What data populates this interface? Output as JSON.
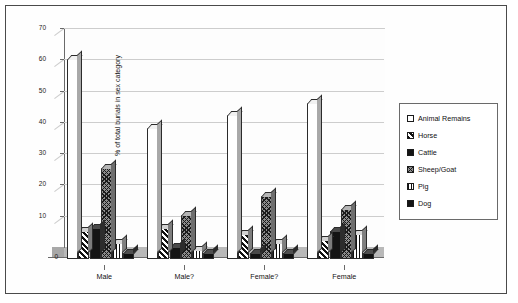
{
  "chart_data": {
    "type": "bar",
    "title": "",
    "xlabel": "",
    "ylabel": "% of total burials in sex category",
    "ylim": [
      0,
      70
    ],
    "yticks": [
      0,
      10,
      20,
      30,
      40,
      50,
      60,
      70
    ],
    "grid": true,
    "legend_position": "right",
    "style": "3d-clustered-column",
    "categories": [
      "Male",
      "Male?",
      "Female?",
      "Female"
    ],
    "series": [
      {
        "name": "Animal Remains",
        "pattern": "blank",
        "values": [
          64,
          42,
          46,
          50
        ]
      },
      {
        "name": "Horse",
        "pattern": "diagonal-hatch",
        "values": [
          9,
          10,
          8,
          6
        ]
      },
      {
        "name": "Cattle",
        "pattern": "solid-black",
        "values": [
          10,
          4,
          2,
          9
        ]
      },
      {
        "name": "Sheep/Goat",
        "pattern": "checkered",
        "values": [
          29,
          14,
          20,
          16
        ]
      },
      {
        "name": "Pig",
        "pattern": "vertical-stripe",
        "values": [
          5,
          3,
          5,
          8
        ]
      },
      {
        "name": "Dog",
        "pattern": "solid-black",
        "values": [
          2,
          2,
          2,
          2
        ]
      }
    ]
  },
  "legend": {
    "items": [
      {
        "label": "Animal Remains",
        "swatch": "blank-swatch"
      },
      {
        "label": "Horse",
        "swatch": "diagonal-hatch-swatch"
      },
      {
        "label": "Cattle",
        "swatch": "solid-black-swatch"
      },
      {
        "label": "Sheep/Goat",
        "swatch": "checkered-swatch"
      },
      {
        "label": "Pig",
        "swatch": "vertical-stripe-swatch"
      },
      {
        "label": "Dog",
        "swatch": "solid-black-swatch"
      }
    ]
  },
  "colors": {
    "background": "#ffffff",
    "frame": "#4a4a4a",
    "axis": "#6a6a6a",
    "grid": "#cdcdcd",
    "floor": "#b9b9b9",
    "ink": "#111111"
  }
}
